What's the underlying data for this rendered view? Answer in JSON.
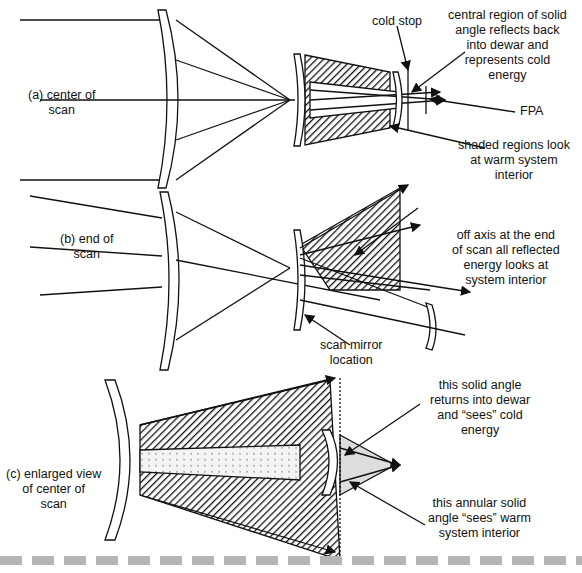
{
  "panels": [
    {
      "id": "a",
      "label_line1": "(a) center of",
      "label_line2": "scan"
    },
    {
      "id": "b",
      "label_line1": "(b) end of",
      "label_line2": "scan"
    },
    {
      "id": "c",
      "label_line1": "(c) enlarged view",
      "label_line2": "of center of",
      "label_line3": "scan"
    }
  ],
  "annotations": {
    "cold_stop": "cold stop",
    "central_region": [
      "central region of solid",
      "angle reflects back",
      "into dewar and",
      "represents cold",
      "energy"
    ],
    "fpa": "FPA",
    "shaded_regions": [
      "shaded regions look",
      "at warm system",
      "interior"
    ],
    "off_axis": [
      "off axis at the end",
      "of scan all reflected",
      "energy looks at",
      "system interior"
    ],
    "scan_mirror": [
      "scan mirror",
      "location"
    ],
    "solid_angle_returns": [
      "this solid angle",
      "returns into dewar",
      "and “sees” cold",
      "energy"
    ],
    "annular_solid_angle": [
      "this annular solid",
      "angle “sees” warm",
      "system interior"
    ]
  }
}
